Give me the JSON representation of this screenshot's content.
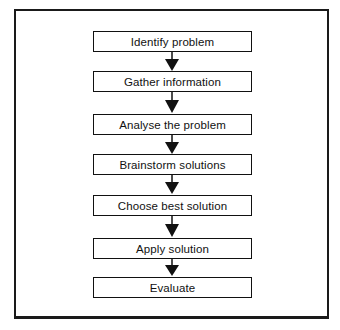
{
  "diagram": {
    "type": "flowchart",
    "direction": "top-to-bottom",
    "steps": [
      {
        "label": "Identify problem"
      },
      {
        "label": "Gather information"
      },
      {
        "label": "Analyse the problem"
      },
      {
        "label": "Brainstorm solutions"
      },
      {
        "label": "Choose best solution"
      },
      {
        "label": "Apply solution"
      },
      {
        "label": "Evaluate"
      }
    ],
    "connectors": [
      {
        "from": 0,
        "to": 1,
        "style": "arrow"
      },
      {
        "from": 1,
        "to": 2,
        "style": "arrow"
      },
      {
        "from": 2,
        "to": 3,
        "style": "arrow"
      },
      {
        "from": 3,
        "to": 4,
        "style": "arrow"
      },
      {
        "from": 4,
        "to": 5,
        "style": "arrow"
      },
      {
        "from": 5,
        "to": 6,
        "style": "arrow"
      }
    ],
    "colors": {
      "stroke": "#111111",
      "fill": "#ffffff",
      "background": "#ffffff"
    }
  }
}
